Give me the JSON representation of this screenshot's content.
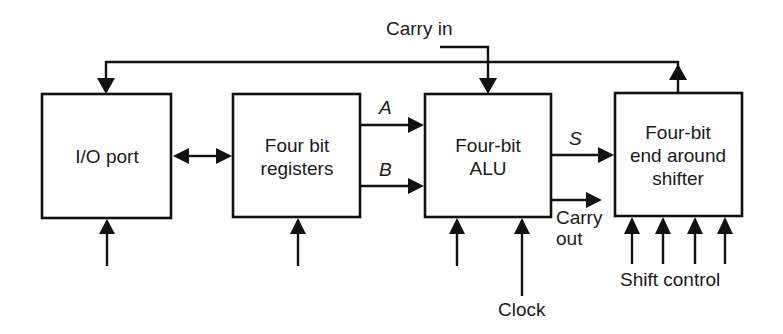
{
  "diagram": {
    "blocks": {
      "io_port": {
        "line1": "I/O port"
      },
      "registers": {
        "line1": "Four bit",
        "line2": "registers"
      },
      "alu": {
        "line1": "Four-bit",
        "line2": "ALU"
      },
      "shifter": {
        "line1": "Four-bit",
        "line2": "end around",
        "line3": "shifter"
      }
    },
    "signals": {
      "carry_in": "Carry in",
      "a": "A",
      "b": "B",
      "s": "S",
      "carry_out_line1": "Carry",
      "carry_out_line2": "out",
      "clock": "Clock",
      "shift_control": "Shift control"
    },
    "colors": {
      "line": "#111111",
      "background": "#ffffff",
      "text": "#1a1a1a"
    }
  }
}
